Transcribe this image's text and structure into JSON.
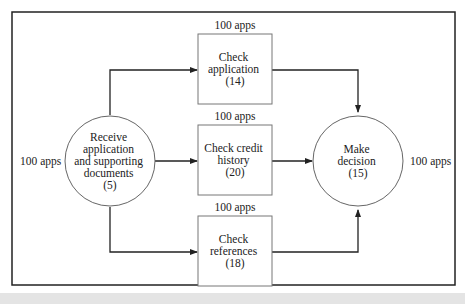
{
  "diagram": {
    "nodes": [
      {
        "id": "receive",
        "shape": "circle",
        "lines": [
          "Receive",
          "application",
          "and supporting",
          "documents",
          "(5)"
        ],
        "input_label": "100 apps"
      },
      {
        "id": "check-application",
        "shape": "box",
        "lines": [
          "Check",
          "application",
          "(14)"
        ],
        "top_label": "100 apps"
      },
      {
        "id": "check-credit",
        "shape": "box",
        "lines": [
          "Check credit",
          "history",
          "(20)"
        ],
        "top_label": "100 apps"
      },
      {
        "id": "check-references",
        "shape": "box",
        "lines": [
          "Check",
          "references",
          "(18)"
        ],
        "top_label": "100 apps"
      },
      {
        "id": "decision",
        "shape": "circle",
        "lines": [
          "Make",
          "decision",
          "(15)"
        ],
        "output_label": "100 apps"
      }
    ],
    "edges": [
      {
        "from": "receive",
        "to": "check-application"
      },
      {
        "from": "receive",
        "to": "check-credit"
      },
      {
        "from": "receive",
        "to": "check-references"
      },
      {
        "from": "check-application",
        "to": "decision"
      },
      {
        "from": "check-credit",
        "to": "decision"
      },
      {
        "from": "check-references",
        "to": "decision"
      }
    ],
    "colors": {
      "line": "#222222",
      "node_border": "#555555",
      "background": "#ffffff"
    }
  }
}
